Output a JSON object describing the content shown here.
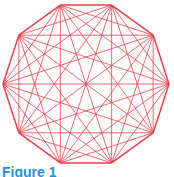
{
  "figure": {
    "shape": "regular decagon with all diagonals",
    "vertices": 10,
    "center": [
      86,
      84
    ],
    "radius": 83,
    "stroke_color": "#e8404a",
    "caption": "Figure 1"
  }
}
